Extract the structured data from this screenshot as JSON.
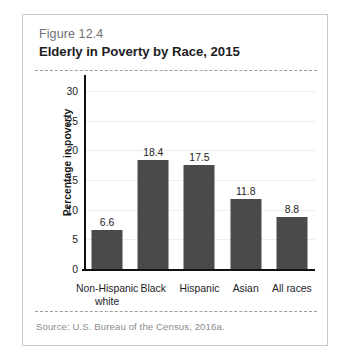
{
  "figure": {
    "number": "Figure 12.4",
    "title": "Elderly in Poverty by Race, 2015",
    "source": "Source: U.S. Bureau of the Census, 2016a."
  },
  "colors": {
    "bar_fill": "#4a4a4a",
    "axis": "#111111",
    "gridline": "#ededed",
    "frame_border": "#c9c9c9",
    "dashed_rule": "#9d9d9d",
    "figure_number_text": "#6f7174",
    "title_text": "#1d1d1f",
    "source_text": "#8a8c8e"
  },
  "chart_data": {
    "type": "bar",
    "title": "Elderly in Poverty by Race, 2015",
    "subtitle": "Figure 12.4",
    "xlabel": "",
    "ylabel": "Percentage in poverty",
    "categories": [
      "Non-Hispanic white",
      "Black",
      "Hispanic",
      "Asian",
      "All races"
    ],
    "category_lines": [
      [
        "Non-Hispanic",
        "white"
      ],
      [
        "Black"
      ],
      [
        "Hispanic"
      ],
      [
        "Asian"
      ],
      [
        "All races"
      ]
    ],
    "values": [
      6.6,
      18.4,
      17.5,
      11.8,
      8.8
    ],
    "value_labels": [
      "6.6",
      "18.4",
      "17.5",
      "11.8",
      "8.8"
    ],
    "ylim": [
      0,
      31
    ],
    "yticks": [
      0,
      5,
      10,
      15,
      20,
      25,
      30
    ],
    "ytick_labels": [
      "0",
      "5",
      "10",
      "15",
      "20",
      "25",
      "30"
    ],
    "grid": true,
    "legend": false,
    "series_color": "#4a4a4a",
    "source": "Source: U.S. Bureau of the Census, 2016a."
  }
}
